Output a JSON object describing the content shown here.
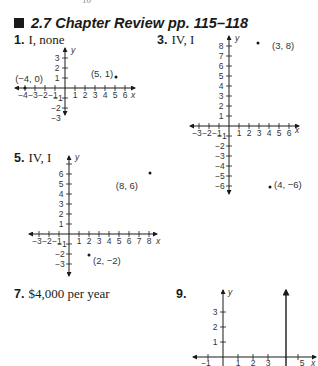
{
  "page": {
    "running_number": "10"
  },
  "section": {
    "title": "2.7  Chapter Review  pp. 115–118"
  },
  "answers": [
    {
      "num": "1.",
      "text": "I, none"
    },
    {
      "num": "3.",
      "text": "IV, I"
    },
    {
      "num": "5.",
      "text": "IV, I"
    },
    {
      "num": "7.",
      "text": "$4,000 per year"
    },
    {
      "num": "9.",
      "text": ""
    }
  ],
  "icons": {
    "section_marker": "filled-square-icon"
  },
  "graphs": [
    {
      "problem": "1",
      "x_ticks": [
        "−4",
        "−3",
        "−2",
        "−1",
        "1",
        "2",
        "3",
        "4",
        "5",
        "6"
      ],
      "y_ticks": [
        "3",
        "2",
        "1",
        "−1",
        "−2",
        "−3"
      ],
      "points": [
        {
          "label": "(−4, 0)",
          "x": -4,
          "y": 0
        },
        {
          "label": "(5, 1)",
          "x": 5,
          "y": 1
        }
      ],
      "x_label": "x",
      "y_label": "y"
    },
    {
      "problem": "3",
      "x_ticks": [
        "−3",
        "−2",
        "−1",
        "1",
        "2",
        "3",
        "4",
        "5",
        "6"
      ],
      "y_ticks": [
        "8",
        "7",
        "6",
        "5",
        "4",
        "3",
        "2",
        "1",
        "−1",
        "−2",
        "−3",
        "−4",
        "−5",
        "−6"
      ],
      "points": [
        {
          "label": "(3, 8)",
          "x": 3,
          "y": 8
        },
        {
          "label": "(4, −6)",
          "x": 4,
          "y": -6
        }
      ],
      "x_label": "x",
      "y_label": "y"
    },
    {
      "problem": "5",
      "x_ticks": [
        "−3",
        "−2",
        "−1",
        "1",
        "2",
        "3",
        "4",
        "5",
        "6",
        "7",
        "8"
      ],
      "y_ticks": [
        "6",
        "5",
        "4",
        "3",
        "2",
        "1",
        "−1",
        "−2",
        "−3"
      ],
      "points": [
        {
          "label": "(8, 6)",
          "x": 8,
          "y": 6
        },
        {
          "label": "(2, −2)",
          "x": 2,
          "y": -2
        }
      ],
      "x_label": "x",
      "y_label": "y"
    },
    {
      "problem": "9",
      "x_ticks": [
        "−1",
        "1",
        "2",
        "3",
        "5"
      ],
      "y_ticks": [
        "3",
        "2",
        "1"
      ],
      "lines": [
        {
          "description": "vertical line x = 4"
        }
      ],
      "x_label": "x",
      "y_label": "y"
    }
  ]
}
